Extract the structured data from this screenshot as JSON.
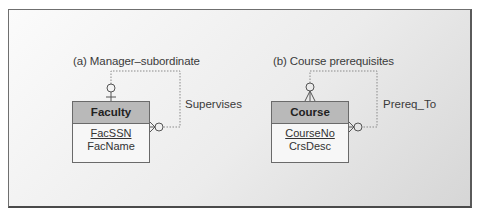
{
  "diagrams": [
    {
      "caption": "(a) Manager–subordinate",
      "entity": {
        "name": "Faculty",
        "primary_key": "FacSSN",
        "attributes": [
          "FacName"
        ]
      },
      "relationship": {
        "name": "Supervises",
        "type": "self-referencing 1:M",
        "one_end": "top (optional one)",
        "many_end": "right (optional many)"
      }
    },
    {
      "caption": "(b) Course prerequisites",
      "entity": {
        "name": "Course",
        "primary_key": "CourseNo",
        "attributes": [
          "CrsDesc"
        ]
      },
      "relationship": {
        "name": "Prereq_To",
        "type": "self-referencing M:N",
        "one_end": "top (optional many)",
        "many_end": "right (optional many)"
      }
    }
  ],
  "colors": {
    "frame_border": "#6f6f6f",
    "entity_header": "#b9b9b9",
    "entity_body": "#f7f7f7",
    "line": "#8a8a8a"
  }
}
